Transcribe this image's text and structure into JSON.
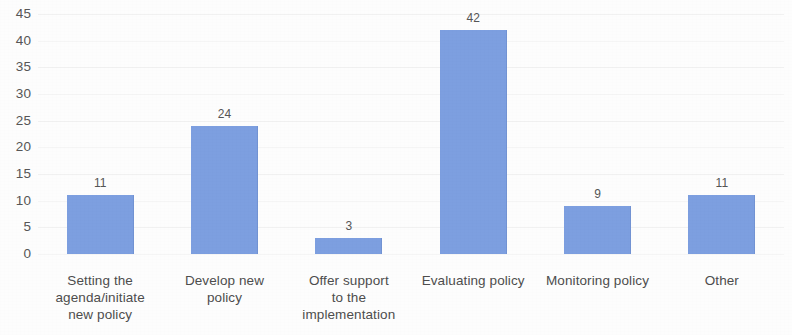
{
  "chart_data": {
    "type": "bar",
    "title": "",
    "subtitle": "",
    "xlabel": "",
    "ylabel": "",
    "categories": [
      "Setting the agenda/initiate new policy",
      "Develop new policy",
      "Offer support to the implementation",
      "Evaluating policy",
      "Monitoring policy",
      "Other"
    ],
    "category_lines": [
      [
        "Setting the",
        "agenda/initiate",
        "new policy"
      ],
      [
        "Develop new",
        "policy"
      ],
      [
        "Offer support",
        "to the",
        "implementation"
      ],
      [
        "Evaluating policy"
      ],
      [
        "Monitoring policy"
      ],
      [
        "Other"
      ]
    ],
    "values": [
      11,
      24,
      3,
      42,
      9,
      11
    ],
    "value_labels": [
      "11",
      "24",
      "3",
      "42",
      "9",
      "11"
    ],
    "ylim": [
      0,
      45
    ],
    "ytick_step": 5,
    "yticks": [
      45,
      40,
      35,
      30,
      25,
      20,
      15,
      10,
      5,
      0
    ],
    "ytick_labels": [
      "45",
      "40",
      "35",
      "30",
      "25",
      "20",
      "15",
      "10",
      "5",
      "0"
    ],
    "grid": true,
    "grid_axis": "y",
    "legend": false,
    "legend_position": "none",
    "bar_color": "#7d9fe0",
    "text_color": "#4a4a4a",
    "background_color": "#fdfdfd",
    "gridline_color": "#f1f1f1",
    "series": [
      {
        "name": "Responses",
        "values": [
          11,
          24,
          3,
          42,
          9,
          11
        ]
      }
    ]
  }
}
